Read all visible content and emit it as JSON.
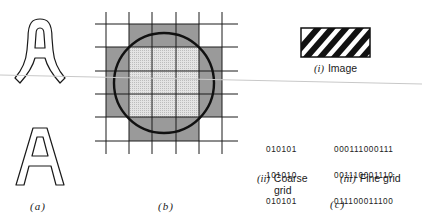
{
  "figure": {
    "panels": {
      "a": {
        "label": "(a)",
        "description": "Letter A outlines: stylized (top) and plain (bottom)"
      },
      "b": {
        "label": "(b)",
        "description": "Circle over grid with cells shaded by coverage"
      },
      "c": {
        "label": "(c)",
        "image": {
          "roman": "(i)",
          "caption": "Image"
        },
        "coarse": {
          "roman": "(ii)",
          "caption_line1": "Coarse",
          "caption_line2": "grid",
          "rows": [
            "010101",
            "101010",
            "010101",
            "101010",
            "010101"
          ]
        },
        "fine": {
          "roman": "(iii)",
          "caption": "Fine grid",
          "rows": [
            "000111000111",
            "001110001110",
            "011100011100",
            "111000111000",
            "110001110001"
          ]
        }
      }
    },
    "colors": {
      "ink": "#1a1a1a",
      "shade_dark": "#9a9a9a",
      "shade_light": "#d6d6d6",
      "scan_line": "#c8c8c8"
    }
  }
}
